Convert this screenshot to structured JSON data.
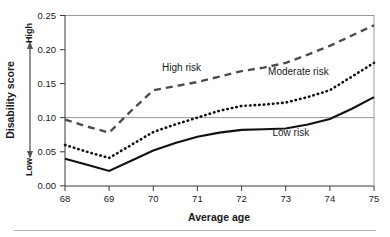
{
  "chart_data": {
    "type": "line",
    "title": "",
    "xlabel": "Average age",
    "ylabel": "Disability score",
    "xlim": [
      68,
      75
    ],
    "ylim": [
      0.0,
      0.25
    ],
    "grid": "horizontal reference line at 0.10 and top border at 0.25",
    "legend": "inline annotations next to each curve",
    "x": [
      68,
      68.5,
      69,
      69.5,
      70,
      70.5,
      71,
      71.5,
      72,
      72.5,
      73,
      73.5,
      74,
      74.5,
      75
    ],
    "xtick_labels": [
      "68",
      "69",
      "70",
      "71",
      "72",
      "73",
      "74",
      "75"
    ],
    "ytick_labels": [
      "0.00",
      "0.05",
      "0.10",
      "0.15",
      "0.20",
      "0.25"
    ],
    "yticks": [
      0.0,
      0.05,
      0.1,
      0.15,
      0.2,
      0.25
    ],
    "y_axis_direction_low": "Low",
    "y_axis_direction_high": "High",
    "series": [
      {
        "name": "High risk",
        "style": "dashed",
        "color": "#4d4d4d",
        "values": [
          0.097,
          0.087,
          0.078,
          0.11,
          0.14,
          0.146,
          0.152,
          0.16,
          0.168,
          0.173,
          0.18,
          0.192,
          0.205,
          0.22,
          0.235
        ]
      },
      {
        "name": "Moderate risk",
        "style": "dotted",
        "color": "#111111",
        "values": [
          0.06,
          0.05,
          0.041,
          0.06,
          0.079,
          0.09,
          0.1,
          0.11,
          0.117,
          0.119,
          0.122,
          0.13,
          0.14,
          0.16,
          0.18
        ]
      },
      {
        "name": "Low risk",
        "style": "solid",
        "color": "#111111",
        "values": [
          0.04,
          0.031,
          0.022,
          0.037,
          0.052,
          0.063,
          0.072,
          0.078,
          0.082,
          0.083,
          0.084,
          0.09,
          0.098,
          0.113,
          0.13
        ]
      }
    ],
    "annotations": [
      {
        "text": "High risk",
        "x": 70.2,
        "y": 0.168
      },
      {
        "text": "Moderate risk",
        "x": 72.6,
        "y": 0.163
      },
      {
        "text": "Low risk",
        "x": 72.7,
        "y": 0.073
      }
    ]
  },
  "axis": {
    "x_title": "Average age",
    "y_title": "Disability score",
    "y_high": "High",
    "y_low": "Low"
  }
}
